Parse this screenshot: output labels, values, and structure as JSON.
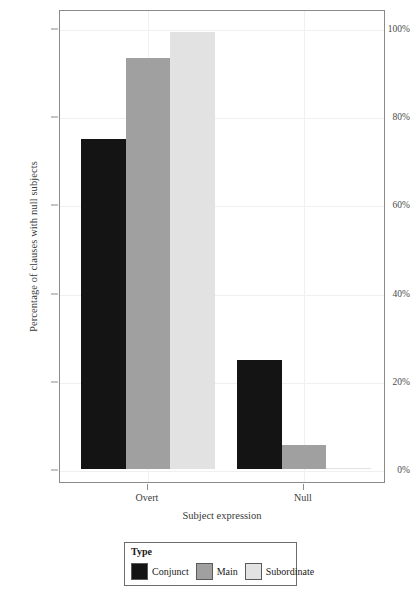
{
  "chart_data": {
    "type": "bar",
    "title": "",
    "xlabel": "Subject expression",
    "ylabel": "Percentage of clauses with null subjects",
    "categories": [
      "Overt",
      "Null"
    ],
    "series": [
      {
        "name": "Conjunct",
        "color": "#141414",
        "values": [
          74.8,
          24.7
        ]
      },
      {
        "name": "Main",
        "color": "#a0a0a0",
        "values": [
          93.1,
          5.4
        ]
      },
      {
        "name": "Subordinate",
        "color": "#e2e2e2",
        "values": [
          99.1,
          0.3
        ]
      }
    ],
    "ylim": [
      0,
      104
    ],
    "yticks": [
      0,
      20,
      40,
      60,
      80,
      100
    ],
    "ytick_labels": [
      "0%",
      "20%",
      "40%",
      "60%",
      "80%",
      "100%"
    ],
    "grid": "horizontal-and-vertical-light",
    "legend": {
      "title": "Type",
      "position": "bottom-center"
    }
  }
}
